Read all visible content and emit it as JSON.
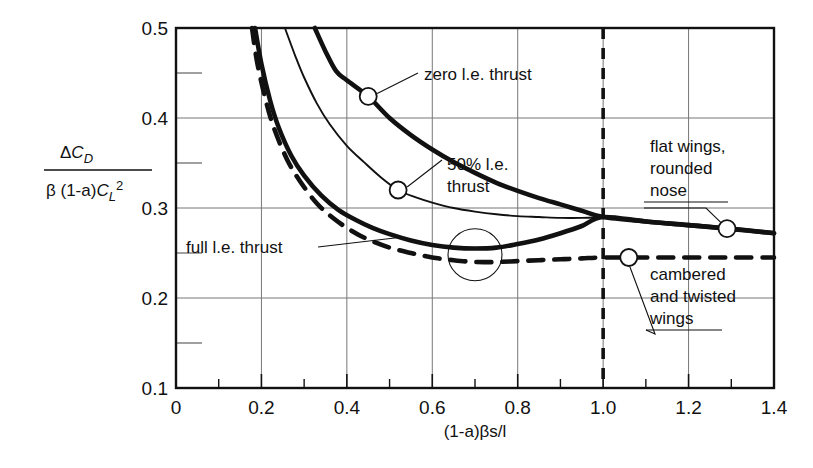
{
  "chart_data": {
    "type": "line",
    "title": "",
    "xlabel": "(1-a)βs/l",
    "ylabel_numerator": "ΔC_D",
    "ylabel_denominator": "β (1-a)C_L²",
    "xlim": [
      0,
      1.4
    ],
    "ylim": [
      0.1,
      0.5
    ],
    "xticks": [
      "0",
      "0.2",
      "0.4",
      "0.6",
      "0.8",
      "1.0",
      "1.2",
      "1.4"
    ],
    "xtick_values": [
      0,
      0.2,
      0.4,
      0.6,
      0.8,
      1.0,
      1.2,
      1.4
    ],
    "yticks": [
      "0.1",
      "0.2",
      "0.3",
      "0.4",
      "0.5"
    ],
    "ytick_values": [
      0.1,
      0.2,
      0.3,
      0.4,
      0.5
    ],
    "yminor_values": [
      0.15,
      0.25,
      0.35,
      0.45
    ],
    "grid": true,
    "legend_position": "inline-annotations",
    "reference_line": {
      "name": "vertical-dashed-at-one",
      "x": 1.0,
      "style": "dashed"
    },
    "convergence_point": {
      "x": 1.0,
      "y": 0.29
    },
    "series": [
      {
        "name": "zero l.e. thrust",
        "style": "solid-thick",
        "points": [
          [
            0.325,
            0.5
          ],
          [
            0.35,
            0.474
          ],
          [
            0.375,
            0.452
          ],
          [
            0.4,
            0.442
          ],
          [
            0.45,
            0.424
          ],
          [
            0.5,
            0.4
          ],
          [
            0.55,
            0.381
          ],
          [
            0.6,
            0.365
          ],
          [
            0.65,
            0.351
          ],
          [
            0.7,
            0.339
          ],
          [
            0.75,
            0.328
          ],
          [
            0.8,
            0.319
          ],
          [
            0.85,
            0.311
          ],
          [
            0.9,
            0.304
          ],
          [
            0.95,
            0.297
          ],
          [
            1.0,
            0.29
          ],
          [
            1.1,
            0.285
          ],
          [
            1.2,
            0.281
          ],
          [
            1.3,
            0.277
          ],
          [
            1.4,
            0.272
          ]
        ]
      },
      {
        "name": "50% l.e. thrust",
        "style": "solid-thin",
        "points": [
          [
            0.255,
            0.5
          ],
          [
            0.28,
            0.468
          ],
          [
            0.3,
            0.445
          ],
          [
            0.33,
            0.416
          ],
          [
            0.36,
            0.393
          ],
          [
            0.4,
            0.369
          ],
          [
            0.44,
            0.351
          ],
          [
            0.48,
            0.334
          ],
          [
            0.52,
            0.32
          ],
          [
            0.56,
            0.312
          ],
          [
            0.6,
            0.306
          ],
          [
            0.65,
            0.3
          ],
          [
            0.7,
            0.296
          ],
          [
            0.75,
            0.293
          ],
          [
            0.8,
            0.291
          ],
          [
            0.85,
            0.29
          ],
          [
            0.9,
            0.289
          ],
          [
            0.95,
            0.289
          ],
          [
            1.0,
            0.29
          ]
        ]
      },
      {
        "name": "full l.e. thrust",
        "label_right": "flat wings, rounded nose",
        "style": "solid-thick",
        "points": [
          [
            0.185,
            0.5
          ],
          [
            0.2,
            0.46
          ],
          [
            0.22,
            0.42
          ],
          [
            0.24,
            0.39
          ],
          [
            0.27,
            0.358
          ],
          [
            0.3,
            0.336
          ],
          [
            0.34,
            0.314
          ],
          [
            0.38,
            0.298
          ],
          [
            0.42,
            0.287
          ],
          [
            0.46,
            0.278
          ],
          [
            0.5,
            0.271
          ],
          [
            0.55,
            0.264
          ],
          [
            0.6,
            0.259
          ],
          [
            0.65,
            0.256
          ],
          [
            0.7,
            0.255
          ],
          [
            0.75,
            0.256
          ],
          [
            0.8,
            0.26
          ],
          [
            0.85,
            0.265
          ],
          [
            0.9,
            0.272
          ],
          [
            0.95,
            0.28
          ],
          [
            1.0,
            0.29
          ],
          [
            1.1,
            0.285
          ],
          [
            1.2,
            0.281
          ],
          [
            1.29,
            0.277
          ],
          [
            1.4,
            0.272
          ]
        ]
      },
      {
        "name": "cambered and twisted wings",
        "style": "dashed-thick",
        "points": [
          [
            0.178,
            0.5
          ],
          [
            0.19,
            0.462
          ],
          [
            0.21,
            0.42
          ],
          [
            0.23,
            0.388
          ],
          [
            0.26,
            0.354
          ],
          [
            0.29,
            0.33
          ],
          [
            0.33,
            0.305
          ],
          [
            0.37,
            0.288
          ],
          [
            0.41,
            0.275
          ],
          [
            0.45,
            0.265
          ],
          [
            0.5,
            0.256
          ],
          [
            0.55,
            0.25
          ],
          [
            0.6,
            0.245
          ],
          [
            0.65,
            0.242
          ],
          [
            0.7,
            0.24
          ],
          [
            0.75,
            0.24
          ],
          [
            0.8,
            0.241
          ],
          [
            0.85,
            0.242
          ],
          [
            0.9,
            0.243
          ],
          [
            0.95,
            0.244
          ],
          [
            1.0,
            0.245
          ],
          [
            1.1,
            0.245
          ],
          [
            1.2,
            0.245
          ],
          [
            1.3,
            0.245
          ],
          [
            1.4,
            0.245
          ]
        ]
      }
    ],
    "markers": [
      {
        "name": "zero-thrust-marker",
        "x": 0.45,
        "y": 0.424
      },
      {
        "name": "fifty-thrust-marker",
        "x": 0.52,
        "y": 0.32
      },
      {
        "name": "flat-wings-marker",
        "x": 1.29,
        "y": 0.277
      },
      {
        "name": "cambered-wings-marker",
        "x": 1.06,
        "y": 0.245
      }
    ],
    "annotations": [
      {
        "name": "zero-le-thrust-label",
        "text": "zero l.e. thrust"
      },
      {
        "name": "fifty-le-thrust-label",
        "line1": "50% l.e.",
        "line2": "thrust"
      },
      {
        "name": "full-le-thrust-label",
        "text": "full l.e. thrust"
      },
      {
        "name": "flat-wings-label",
        "line1": "flat wings,",
        "line2": "rounded",
        "line3": "nose"
      },
      {
        "name": "cambered-wings-label",
        "line1": "cambered",
        "line2": "and twisted",
        "line3": "wings"
      }
    ]
  },
  "axis": {
    "x_label": "(1-a)βs/l",
    "y_numerator_delta": "Δ",
    "y_numerator_c": "C",
    "y_numerator_sub": "D",
    "y_denom_beta": "β (1-a)",
    "y_denom_c": "C",
    "y_denom_sub": "L",
    "y_denom_sup": "2",
    "xticks": [
      "0",
      "0.2",
      "0.4",
      "0.6",
      "0.8",
      "1.0",
      "1.2",
      "1.4"
    ],
    "yticks": [
      "0.5",
      "0.4",
      "0.3",
      "0.2",
      "0.1"
    ]
  },
  "labels": {
    "zero_thrust": "zero l.e. thrust",
    "fifty_thrust_l1": "50% l.e.",
    "fifty_thrust_l2": "thrust",
    "full_thrust": "full l.e. thrust",
    "flat_wings_l1": "flat wings,",
    "flat_wings_l2": "rounded",
    "flat_wings_l3": "nose",
    "cambered_l1": "cambered",
    "cambered_l2": "and twisted",
    "cambered_l3": "wings"
  },
  "colors": {
    "ink": "#111111",
    "grid": "#6f6f6f",
    "background": "#ffffff"
  }
}
